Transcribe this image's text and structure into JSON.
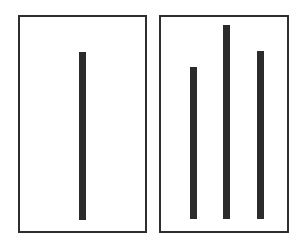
{
  "colors": {
    "frame_border": "#2e2e2e",
    "bar_fill": "#2b2b2b",
    "background": "#ffffff"
  },
  "panels": [
    {
      "name": "reference-panel",
      "frame": {
        "x": 18,
        "y": 15,
        "width": 129,
        "height": 218
      },
      "bars": [
        {
          "x": 79,
          "top": 52,
          "bottom": 220,
          "width": 7,
          "height": 168
        }
      ]
    },
    {
      "name": "comparison-panel",
      "frame": {
        "x": 159,
        "y": 15,
        "width": 130,
        "height": 218
      },
      "bars": [
        {
          "x": 190,
          "top": 67,
          "bottom": 219,
          "width": 7,
          "height": 152
        },
        {
          "x": 223,
          "top": 25,
          "bottom": 219,
          "width": 7,
          "height": 194
        },
        {
          "x": 257,
          "top": 51,
          "bottom": 219,
          "width": 7,
          "height": 168
        }
      ]
    }
  ]
}
